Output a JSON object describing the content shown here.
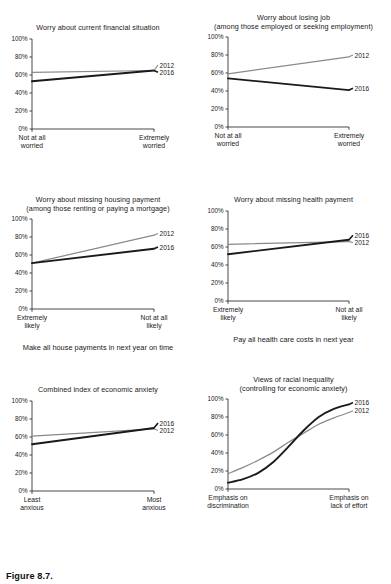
{
  "figure": {
    "caption": "Figure 8.7.",
    "series_names": [
      "2012",
      "2016"
    ],
    "colors": {
      "line_2012": "#8a8a8a",
      "line_2016": "#1a1a1a",
      "axis": "#333333",
      "text": "#1a1a1a"
    },
    "y_ticks": [
      "0%",
      "20%",
      "40%",
      "60%",
      "80%",
      "100%"
    ]
  },
  "chart_data": [
    {
      "id": "worry-current-financial",
      "type": "line",
      "title": "Worry about current financial situation",
      "xlabel": "",
      "ylabel": "",
      "ylim": [
        0,
        100
      ],
      "grid": false,
      "legend_position": "right-end",
      "x_tick_labels": [
        "Not at all\nworried",
        "Extremely\nworried"
      ],
      "x": [
        0,
        1
      ],
      "series": [
        {
          "name": "2012",
          "values": [
            63,
            65
          ]
        },
        {
          "name": "2016",
          "values": [
            53,
            65
          ]
        }
      ],
      "legend_order": [
        "2012",
        "2016"
      ]
    },
    {
      "id": "worry-losing-job",
      "type": "line",
      "title": "Worry about losing job\n(among those employed or seeking employment)",
      "xlabel": "",
      "ylabel": "",
      "ylim": [
        0,
        100
      ],
      "grid": false,
      "legend_position": "right-end",
      "x_tick_labels": [
        "Not at all\nworried",
        "Extremely\nworried"
      ],
      "x": [
        0,
        1
      ],
      "series": [
        {
          "name": "2012",
          "values": [
            59,
            78
          ]
        },
        {
          "name": "2016",
          "values": [
            54,
            41
          ]
        }
      ],
      "legend_order": [
        "2012",
        "2016"
      ]
    },
    {
      "id": "worry-missing-housing-payment",
      "type": "line",
      "title": "Worry about missing housing payment\n(among those renting or paying a mortgage)",
      "xlabel": "Make all house payments in next year on time",
      "ylabel": "",
      "ylim": [
        0,
        100
      ],
      "grid": false,
      "legend_position": "right-end",
      "x_tick_labels": [
        "Extremely\nlikely",
        "Not at all\nlikely"
      ],
      "x": [
        0,
        1
      ],
      "series": [
        {
          "name": "2012",
          "values": [
            51,
            82
          ]
        },
        {
          "name": "2016",
          "values": [
            51,
            67
          ]
        }
      ],
      "legend_order": [
        "2012",
        "2016"
      ]
    },
    {
      "id": "worry-missing-health-payment",
      "type": "line",
      "title": "Worry about missing health payment",
      "xlabel": "Pay all health care costs in next year",
      "ylabel": "",
      "ylim": [
        0,
        100
      ],
      "grid": false,
      "legend_position": "right-end",
      "x_tick_labels": [
        "Extremely\nlikely",
        "Not at all\nlikely"
      ],
      "x": [
        0,
        1
      ],
      "series": [
        {
          "name": "2012",
          "values": [
            63,
            66
          ]
        },
        {
          "name": "2016",
          "values": [
            52,
            68
          ]
        }
      ],
      "legend_order": [
        "2016",
        "2012"
      ]
    },
    {
      "id": "combined-index-economic-anxiety",
      "type": "line",
      "title": "Combined index of economic anxiety",
      "xlabel": "",
      "ylabel": "",
      "ylim": [
        0,
        100
      ],
      "grid": false,
      "legend_position": "right-end",
      "x_tick_labels": [
        "Least\nanxious",
        "Most\nanxious"
      ],
      "x": [
        0,
        1
      ],
      "series": [
        {
          "name": "2012",
          "values": [
            61,
            69
          ]
        },
        {
          "name": "2016",
          "values": [
            52,
            70
          ]
        }
      ],
      "legend_order": [
        "2016",
        "2012"
      ]
    },
    {
      "id": "views-racial-inequality",
      "type": "line",
      "title": "Views of racial inequality\n(controlling for economic anxiety)",
      "xlabel": "",
      "ylabel": "",
      "ylim": [
        0,
        100
      ],
      "grid": false,
      "legend_position": "right-end",
      "x_tick_labels": [
        "Emphasis on\ndiscrimination",
        "Emphasis on\nlack of effort"
      ],
      "x": [
        0,
        0.125,
        0.25,
        0.375,
        0.5,
        0.625,
        0.75,
        0.875,
        1
      ],
      "series": [
        {
          "name": "2012",
          "values": [
            17,
            24,
            32,
            41,
            52,
            62,
            72,
            79,
            85
          ]
        },
        {
          "name": "2016",
          "values": [
            7,
            11,
            18,
            30,
            47,
            65,
            80,
            89,
            94
          ]
        }
      ],
      "legend_order": [
        "2016",
        "2012"
      ]
    }
  ]
}
